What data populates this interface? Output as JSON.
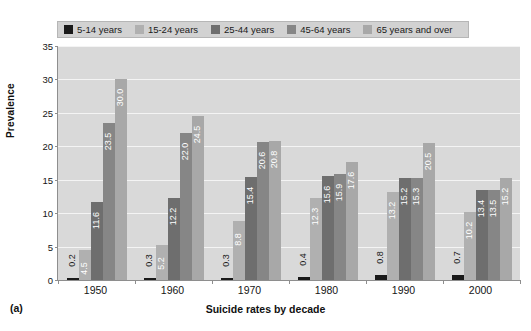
{
  "figure": {
    "panel_label": "(a)"
  },
  "chart_data": {
    "type": "bar",
    "title": "",
    "xlabel": "Suicide rates by decade",
    "ylabel": "Prevalence",
    "categories": [
      "1950",
      "1960",
      "1970",
      "1980",
      "1990",
      "2000"
    ],
    "ylim": [
      0,
      35
    ],
    "yticks": [
      0,
      5,
      10,
      15,
      20,
      25,
      30,
      35
    ],
    "grid": true,
    "legend_position": "top",
    "series": [
      {
        "name": "5-14 years",
        "color": "#1a1a1a",
        "values": [
          0.2,
          0.3,
          0.3,
          0.4,
          0.8,
          0.7
        ],
        "labels": [
          "0.2",
          "0.3",
          "0.3",
          "0.4",
          "0.8",
          "0.7"
        ]
      },
      {
        "name": "15-24 years",
        "color": "#b0b0b0",
        "values": [
          4.5,
          5.2,
          8.8,
          12.3,
          13.2,
          10.2
        ],
        "labels": [
          "4.5",
          "5.2",
          "8.8",
          "12.3",
          "13.2",
          "10.2"
        ]
      },
      {
        "name": "25-44 years",
        "color": "#6e6e6e",
        "values": [
          11.6,
          12.2,
          15.4,
          15.6,
          15.2,
          13.4
        ],
        "labels": [
          "11.6",
          "12.2",
          "15.4",
          "15.6",
          "15.2",
          "13.4"
        ]
      },
      {
        "name": "45-64 years",
        "color": "#868686",
        "values": [
          23.5,
          22.0,
          20.6,
          15.9,
          15.3,
          13.5
        ],
        "labels": [
          "23.5",
          "22.0",
          "20.6",
          "15.9",
          "15.3",
          "13.5"
        ]
      },
      {
        "name": "65 years and over",
        "color": "#a8a8a8",
        "values": [
          30.0,
          24.5,
          20.8,
          17.6,
          20.5,
          15.2
        ],
        "labels": [
          "30.0",
          "24.5",
          "20.8",
          "17.6",
          "20.5",
          "15.2"
        ]
      }
    ]
  }
}
